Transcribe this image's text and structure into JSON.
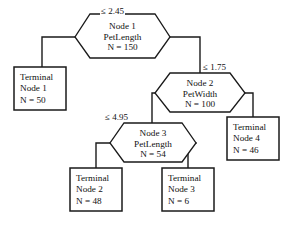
{
  "diagram": {
    "line_color": "#1a1a1a",
    "text_color": "#111111",
    "background": "#ffffff"
  },
  "internal_nodes": [
    {
      "id": "node-1",
      "name": "Node 1",
      "variable": "PetLength",
      "count": "N = 150",
      "split_label": "≤ 2.45"
    },
    {
      "id": "node-2",
      "name": "Node 2",
      "variable": "PetWidth",
      "count": "N = 100",
      "split_label": "≤ 1.75"
    },
    {
      "id": "node-3",
      "name": "Node 3",
      "variable": "PetLength",
      "count": "N = 54",
      "split_label": "≤ 4.95"
    }
  ],
  "terminal_nodes": [
    {
      "id": "terminal-1",
      "line1": "Terminal",
      "line2": "Node 1",
      "line3": "N = 50"
    },
    {
      "id": "terminal-2",
      "line1": "Terminal",
      "line2": "Node 2",
      "line3": "N = 48"
    },
    {
      "id": "terminal-3",
      "line1": "Terminal",
      "line2": "Node 3",
      "line3": "N = 6"
    },
    {
      "id": "terminal-4",
      "line1": "Terminal",
      "line2": "Node 4",
      "line3": "N = 46"
    }
  ]
}
